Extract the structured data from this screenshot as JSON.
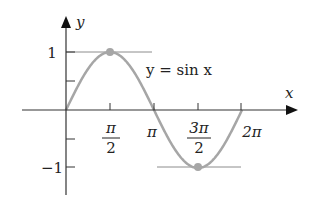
{
  "chart_data": {
    "type": "line",
    "title": "",
    "function_label": "y = sin x",
    "xlabel": "x",
    "ylabel": "y",
    "x_ticks": [
      {
        "value": 1.5708,
        "label_num": "π",
        "label_den": "2"
      },
      {
        "value": 3.1416,
        "label": "π"
      },
      {
        "value": 4.7124,
        "label_num": "3π",
        "label_den": "2"
      },
      {
        "value": 6.2832,
        "label": "2π"
      }
    ],
    "y_ticks": [
      {
        "value": 1,
        "label": "1"
      },
      {
        "value": 0.5,
        "label": ""
      },
      {
        "value": -0.5,
        "label": ""
      },
      {
        "value": -1,
        "label": "−1"
      }
    ],
    "xlim": [
      0,
      7.5
    ],
    "ylim": [
      -1.5,
      1.6
    ],
    "series": [
      {
        "name": "y = sin x",
        "x": [
          0,
          0.7854,
          1.5708,
          2.3562,
          3.1416,
          3.927,
          4.7124,
          5.4978,
          6.2832
        ],
        "y": [
          0,
          0.7071,
          1,
          0.7071,
          0,
          -0.7071,
          -1,
          -0.7071,
          0
        ]
      }
    ],
    "annotations": [
      {
        "type": "point",
        "x": 1.5708,
        "y": 1,
        "desc": "maximum"
      },
      {
        "type": "point",
        "x": 4.7124,
        "y": -1,
        "desc": "minimum"
      },
      {
        "type": "hline",
        "y": 1,
        "x_from": 0,
        "x_to": 3.1
      },
      {
        "type": "hline",
        "y": -1,
        "x_from": 3.2,
        "x_to": 6.2832
      }
    ],
    "grid": false,
    "legend": "none",
    "colors": {
      "curve": "#a6a6a6",
      "axis": "#333333",
      "guide": "#8c8c8c",
      "point": "#a6a6a6"
    }
  },
  "labels": {
    "y_axis": "y",
    "x_axis": "x",
    "function": "y = sin x",
    "y_one": "1",
    "y_neg_one": "−1",
    "pi_over_2_num": "π",
    "pi_over_2_den": "2",
    "pi": "π",
    "three_pi_over_2_num": "3π",
    "three_pi_over_2_den": "2",
    "two_pi": "2π"
  }
}
